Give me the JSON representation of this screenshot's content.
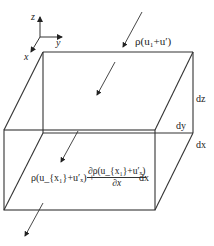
{
  "diagram": {
    "type": "control-volume mass flux diagram",
    "axes": {
      "z_label": "z",
      "y_label": "y",
      "x_label": "x"
    },
    "inflow_label": "ρ(u₁+u′)",
    "outflow_label_left": "ρ(u_{x₁}+u′ₓ) +",
    "outflow_fraction_numerator": "∂ρ(u_{x₁}+u′ₓ)",
    "outflow_fraction_denominator": "∂x",
    "outflow_label_right": "dx",
    "dimensions": {
      "dz": "dz",
      "dy": "dy",
      "dx": "dx"
    },
    "line_color": "#333333"
  }
}
